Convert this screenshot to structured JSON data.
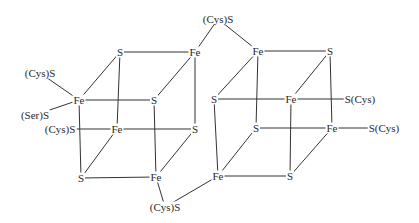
{
  "clusters": [
    {
      "name": "left-cluster",
      "atoms": [
        {
          "id": "L_S1",
          "label": "S",
          "x": 120,
          "y": 52
        },
        {
          "id": "L_Fe1",
          "label": "Fe",
          "x": 195,
          "y": 52
        },
        {
          "id": "L_Fe2",
          "label": "Fe",
          "x": 79,
          "y": 100
        },
        {
          "id": "L_S2",
          "label": "S",
          "x": 154,
          "y": 100
        },
        {
          "id": "L_Fe3",
          "label": "Fe",
          "x": 117,
          "y": 129
        },
        {
          "id": "L_S3",
          "label": "S",
          "x": 195,
          "y": 129
        },
        {
          "id": "L_S4",
          "label": "S",
          "x": 81,
          "y": 178
        },
        {
          "id": "L_Fe4",
          "label": "Fe",
          "x": 156,
          "y": 177
        }
      ],
      "ligands": [
        {
          "id": "L_Lig1",
          "label": "(Cys)S",
          "x": 40,
          "y": 73
        },
        {
          "id": "L_Lig2",
          "label": "(Ser)S",
          "x": 35,
          "y": 115
        },
        {
          "id": "L_Lig3",
          "label": "(Cys)S",
          "x": 60,
          "y": 129
        }
      ]
    },
    {
      "name": "right-cluster",
      "atoms": [
        {
          "id": "R_Fe1",
          "label": "Fe",
          "x": 258,
          "y": 51
        },
        {
          "id": "R_S1",
          "label": "S",
          "x": 330,
          "y": 51
        },
        {
          "id": "R_S2",
          "label": "S",
          "x": 214,
          "y": 99
        },
        {
          "id": "R_Fe2",
          "label": "Fe",
          "x": 291,
          "y": 99
        },
        {
          "id": "R_S3",
          "label": "S",
          "x": 256,
          "y": 128
        },
        {
          "id": "R_Fe3",
          "label": "Fe",
          "x": 332,
          "y": 128
        },
        {
          "id": "R_Fe4",
          "label": "Fe",
          "x": 218,
          "y": 176
        },
        {
          "id": "R_S4",
          "label": "S",
          "x": 290,
          "y": 176
        }
      ],
      "ligands": [
        {
          "id": "R_Lig1",
          "label": "S(Cys)",
          "x": 360,
          "y": 99
        },
        {
          "id": "R_Lig2",
          "label": "S(Cys)",
          "x": 384,
          "y": 128
        }
      ]
    }
  ],
  "bridging_ligands": [
    {
      "id": "B_Top",
      "label": "(Cys)S",
      "x": 218,
      "y": 19
    },
    {
      "id": "B_Bot",
      "label": "(Cys)S",
      "x": 165,
      "y": 207
    }
  ],
  "bonds": [
    [
      "L_S1",
      "L_Fe1"
    ],
    [
      "L_S1",
      "L_Fe2"
    ],
    [
      "L_S1",
      "L_Fe3"
    ],
    [
      "L_Fe1",
      "L_S2"
    ],
    [
      "L_Fe1",
      "L_S3"
    ],
    [
      "L_Fe2",
      "L_S2"
    ],
    [
      "L_Fe2",
      "L_S4"
    ],
    [
      "L_S2",
      "L_Fe4"
    ],
    [
      "L_Fe3",
      "L_S3"
    ],
    [
      "L_Fe3",
      "L_S4"
    ],
    [
      "L_S3",
      "L_Fe4"
    ],
    [
      "L_S4",
      "L_Fe4"
    ],
    [
      "L_Lig1",
      "L_Fe2"
    ],
    [
      "L_Lig2",
      "L_Fe2"
    ],
    [
      "L_Lig3",
      "L_Fe3"
    ],
    [
      "R_Fe1",
      "R_S1"
    ],
    [
      "R_Fe1",
      "R_S2"
    ],
    [
      "R_Fe1",
      "R_S3"
    ],
    [
      "R_S1",
      "R_Fe2"
    ],
    [
      "R_S1",
      "R_Fe3"
    ],
    [
      "R_S2",
      "R_Fe2"
    ],
    [
      "R_S2",
      "R_Fe4"
    ],
    [
      "R_Fe2",
      "R_S4"
    ],
    [
      "R_S3",
      "R_Fe3"
    ],
    [
      "R_S3",
      "R_Fe4"
    ],
    [
      "R_Fe3",
      "R_S4"
    ],
    [
      "R_Fe4",
      "R_S4"
    ],
    [
      "R_Fe2",
      "R_Lig1"
    ],
    [
      "R_Fe3",
      "R_Lig2"
    ],
    [
      "B_Top",
      "L_Fe1"
    ],
    [
      "B_Top",
      "R_Fe1"
    ],
    [
      "B_Bot",
      "L_Fe4"
    ],
    [
      "B_Bot",
      "R_Fe4"
    ]
  ]
}
